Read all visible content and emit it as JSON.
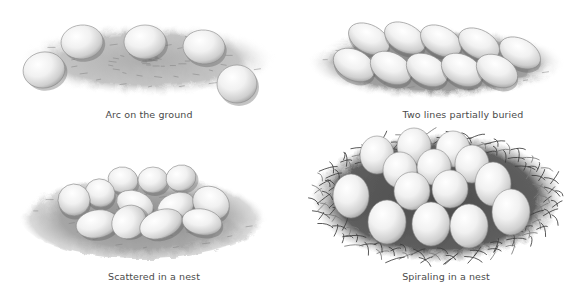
{
  "panels": [
    {
      "id": "arc",
      "caption": "Arc on the ground",
      "caption_pos": [
        149,
        110
      ],
      "ground": {
        "type": "ground",
        "cx": 148,
        "cy": 60,
        "rx": 128,
        "ry": 36,
        "color": "#9a9a9a"
      },
      "eggs": [
        {
          "cx": 44,
          "cy": 70,
          "rx": 21,
          "ry": 18,
          "rot": -10
        },
        {
          "cx": 82,
          "cy": 42,
          "rx": 21,
          "ry": 17,
          "rot": -5
        },
        {
          "cx": 145,
          "cy": 42,
          "rx": 21,
          "ry": 17,
          "rot": 0
        },
        {
          "cx": 204,
          "cy": 47,
          "rx": 21,
          "ry": 17,
          "rot": 5
        },
        {
          "cx": 237,
          "cy": 84,
          "rx": 20,
          "ry": 19,
          "rot": 0
        }
      ]
    },
    {
      "id": "two-lines",
      "caption": "Two lines partially buried",
      "caption_pos": [
        463,
        110
      ],
      "ground": {
        "type": "ground",
        "cx": 436,
        "cy": 63,
        "rx": 128,
        "ry": 36,
        "color": "#8a8a8a"
      },
      "eggs": [
        {
          "cx": 369,
          "cy": 39,
          "rx": 22,
          "ry": 14,
          "rot": 28
        },
        {
          "cx": 405,
          "cy": 38,
          "rx": 22,
          "ry": 14,
          "rot": 28
        },
        {
          "cx": 441,
          "cy": 41,
          "rx": 22,
          "ry": 14,
          "rot": 28
        },
        {
          "cx": 479,
          "cy": 44,
          "rx": 22,
          "ry": 14,
          "rot": 28
        },
        {
          "cx": 520,
          "cy": 53,
          "rx": 22,
          "ry": 14,
          "rot": 28
        },
        {
          "cx": 354,
          "cy": 65,
          "rx": 22,
          "ry": 15,
          "rot": 28
        },
        {
          "cx": 391,
          "cy": 68,
          "rx": 22,
          "ry": 15,
          "rot": 28
        },
        {
          "cx": 427,
          "cy": 70,
          "rx": 22,
          "ry": 15,
          "rot": 28
        },
        {
          "cx": 462,
          "cy": 70,
          "rx": 22,
          "ry": 15,
          "rot": 28
        },
        {
          "cx": 497,
          "cy": 71,
          "rx": 22,
          "ry": 15,
          "rot": 28
        }
      ]
    },
    {
      "id": "scattered",
      "caption": "Scattered in a nest",
      "caption_pos": [
        154,
        272
      ],
      "ground": {
        "type": "nest-soft",
        "cx": 143,
        "cy": 215,
        "rx": 124,
        "ry": 44,
        "color": "#9d9d9d"
      },
      "eggs": [
        {
          "cx": 123,
          "cy": 180,
          "rx": 15,
          "ry": 13,
          "rot": 10
        },
        {
          "cx": 153,
          "cy": 180,
          "rx": 15,
          "ry": 13,
          "rot": 0
        },
        {
          "cx": 181,
          "cy": 178,
          "rx": 15,
          "ry": 13,
          "rot": -10
        },
        {
          "cx": 100,
          "cy": 193,
          "rx": 15,
          "ry": 14,
          "rot": 20
        },
        {
          "cx": 74,
          "cy": 200,
          "rx": 16,
          "ry": 16,
          "rot": 20
        },
        {
          "cx": 135,
          "cy": 204,
          "rx": 19,
          "ry": 13,
          "rot": 20
        },
        {
          "cx": 176,
          "cy": 206,
          "rx": 19,
          "ry": 13,
          "rot": -20
        },
        {
          "cx": 211,
          "cy": 203,
          "rx": 19,
          "ry": 16,
          "rot": 30
        },
        {
          "cx": 97,
          "cy": 224,
          "rx": 21,
          "ry": 14,
          "rot": -10
        },
        {
          "cx": 129,
          "cy": 222,
          "rx": 18,
          "ry": 16,
          "rot": -40
        },
        {
          "cx": 161,
          "cy": 224,
          "rx": 22,
          "ry": 14,
          "rot": -20
        },
        {
          "cx": 202,
          "cy": 222,
          "rx": 20,
          "ry": 13,
          "rot": 10
        }
      ]
    },
    {
      "id": "spiraling",
      "caption": "Spiraling in a nest",
      "caption_pos": [
        446,
        272
      ],
      "ground": {
        "type": "nest-grass",
        "cx": 437,
        "cy": 198,
        "rx": 124,
        "ry": 64,
        "color": "#6a6a6a"
      },
      "eggs": [
        {
          "cx": 377,
          "cy": 155,
          "rx": 17,
          "ry": 19,
          "rot": 0
        },
        {
          "cx": 414,
          "cy": 146,
          "rx": 17,
          "ry": 18,
          "rot": 0
        },
        {
          "cx": 453,
          "cy": 149,
          "rx": 17,
          "ry": 18,
          "rot": 0
        },
        {
          "cx": 400,
          "cy": 170,
          "rx": 17,
          "ry": 18,
          "rot": 0
        },
        {
          "cx": 434,
          "cy": 167,
          "rx": 17,
          "ry": 18,
          "rot": 0
        },
        {
          "cx": 472,
          "cy": 164,
          "rx": 17,
          "ry": 19,
          "rot": 0
        },
        {
          "cx": 351,
          "cy": 196,
          "rx": 18,
          "ry": 22,
          "rot": 0
        },
        {
          "cx": 412,
          "cy": 191,
          "rx": 18,
          "ry": 19,
          "rot": 0
        },
        {
          "cx": 450,
          "cy": 189,
          "rx": 18,
          "ry": 19,
          "rot": 0
        },
        {
          "cx": 493,
          "cy": 184,
          "rx": 18,
          "ry": 22,
          "rot": 0
        },
        {
          "cx": 387,
          "cy": 222,
          "rx": 19,
          "ry": 22,
          "rot": 0
        },
        {
          "cx": 431,
          "cy": 224,
          "rx": 19,
          "ry": 22,
          "rot": 0
        },
        {
          "cx": 469,
          "cy": 226,
          "rx": 19,
          "ry": 22,
          "rot": 0
        },
        {
          "cx": 511,
          "cy": 212,
          "rx": 19,
          "ry": 23,
          "rot": 0
        }
      ]
    }
  ]
}
